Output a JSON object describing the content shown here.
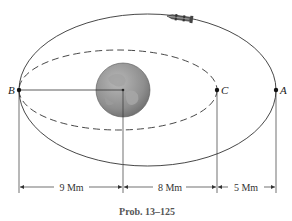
{
  "figure": {
    "caption": "Prob. 13–125",
    "points": {
      "A": "A",
      "B": "B",
      "C": "C"
    },
    "dimensions": [
      {
        "label": "9 Mm",
        "from": "B",
        "to": "Earth center"
      },
      {
        "label": "8 Mm",
        "from": "Earth center",
        "to": "C"
      },
      {
        "label": "5 Mm",
        "from": "C",
        "to": "A"
      }
    ],
    "orbits": {
      "outer": "solid elliptical orbit through B and A",
      "inner": "dashed elliptical orbit through B and C"
    },
    "objects": {
      "planet": "earth-icon",
      "spacecraft": "rocket-icon"
    },
    "colors": {
      "line": "#333333",
      "planet_fill": "#8a8a8a",
      "planet_light": "#b5b5b5",
      "caption": "#555555"
    }
  }
}
